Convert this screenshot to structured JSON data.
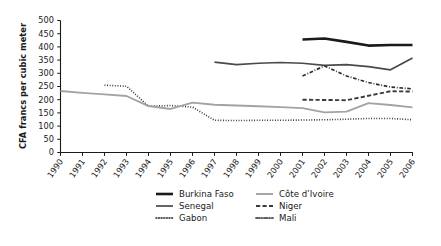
{
  "chart_data": {
    "type": "line",
    "title": "",
    "xlabel": "",
    "ylabel": "CFA francs per cubic meter",
    "xlim": [
      1990,
      2006
    ],
    "ylim": [
      0,
      500
    ],
    "ytick_step": 50,
    "grid": false,
    "legend_position": "bottom",
    "x": [
      1990,
      1991,
      1992,
      1993,
      1994,
      1995,
      1996,
      1997,
      1998,
      1999,
      2000,
      2001,
      2002,
      2003,
      2004,
      2005,
      2006
    ],
    "xticklabels": [
      "1990",
      "1991",
      "1992",
      "1993",
      "1994",
      "1995",
      "1996",
      "1997",
      "1998",
      "1999",
      "2000",
      "2001",
      "2002",
      "2003",
      "2004",
      "2005",
      "2006"
    ],
    "yticklabels": [
      "0",
      "50",
      "100",
      "150",
      "200",
      "250",
      "300",
      "350",
      "400",
      "450",
      "500"
    ],
    "series": [
      {
        "name": "Burkina Faso",
        "style": "solid-thick",
        "color": "#1a1a1a",
        "width": 2.6,
        "x": [
          2001,
          2002,
          2003,
          2004,
          2005,
          2006
        ],
        "values": [
          428,
          432,
          419,
          405,
          407,
          407
        ]
      },
      {
        "name": "Senegal",
        "style": "solid-medium",
        "color": "#4a4a4a",
        "width": 1.7,
        "x": [
          1997,
          1998,
          1999,
          2000,
          2001,
          2002,
          2003,
          2004,
          2005,
          2006
        ],
        "values": [
          342,
          333,
          338,
          341,
          338,
          330,
          333,
          325,
          313,
          358
        ]
      },
      {
        "name": "Gabon",
        "style": "dotted",
        "color": "#262626",
        "width": 1.6,
        "x": [
          1992,
          1993,
          1994,
          1995,
          1996,
          1997,
          1998,
          1999,
          2000,
          2001,
          2002,
          2003,
          2004,
          2005,
          2006
        ],
        "values": [
          255,
          251,
          175,
          178,
          172,
          122,
          121,
          122,
          122,
          123,
          124,
          126,
          129,
          129,
          124
        ]
      },
      {
        "name": "Côte d’Ivoire",
        "style": "solid-light",
        "color": "#a3a3a3",
        "width": 1.9,
        "x": [
          1990,
          1991,
          1992,
          1993,
          1994,
          1995,
          1996,
          1997,
          1998,
          1999,
          2000,
          2001,
          2002,
          2003,
          2004,
          2005,
          2006
        ],
        "values": [
          233,
          226,
          220,
          214,
          176,
          165,
          189,
          181,
          178,
          175,
          172,
          168,
          152,
          155,
          187,
          180,
          171
        ]
      },
      {
        "name": "Niger",
        "style": "dashed",
        "color": "#3a3a3a",
        "width": 1.9,
        "x": [
          2001,
          2002,
          2003,
          2004,
          2005,
          2006
        ],
        "values": [
          200,
          199,
          198,
          215,
          232,
          231
        ]
      },
      {
        "name": "Mali",
        "style": "dash-dot",
        "color": "#2e2e2e",
        "width": 1.7,
        "x": [
          2001,
          2002,
          2003,
          2004,
          2005,
          2006
        ],
        "values": [
          290,
          328,
          290,
          265,
          248,
          241
        ]
      }
    ],
    "legend": [
      {
        "label": "Burkina Faso",
        "style": "solid-thick",
        "color": "#1a1a1a"
      },
      {
        "label": "Côte d’Ivoire",
        "style": "solid-light",
        "color": "#a3a3a3"
      },
      {
        "label": "Senegal",
        "style": "solid-medium",
        "color": "#4a4a4a"
      },
      {
        "label": "Niger",
        "style": "dashed",
        "color": "#3a3a3a"
      },
      {
        "label": "Gabon",
        "style": "dotted",
        "color": "#262626"
      },
      {
        "label": "Mali",
        "style": "dash-dot",
        "color": "#2e2e2e"
      }
    ]
  }
}
